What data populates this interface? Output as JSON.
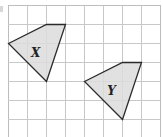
{
  "diagram": {
    "grid": {
      "origin_x": 8,
      "origin_y": 5,
      "cell": 19,
      "cols": 8,
      "rows": 7,
      "line_color": "#c8c8c8",
      "border_color": "#bdbdbd"
    },
    "shapes": [
      {
        "label": "X",
        "vertices": [
          [
            0,
            2
          ],
          [
            2,
            1
          ],
          [
            3,
            1
          ],
          [
            2,
            4
          ]
        ],
        "fill": "#dcdcdc",
        "stroke": "#2a2a2a",
        "label_pos": [
          1.45,
          2.55
        ]
      },
      {
        "label": "Y",
        "vertices": [
          [
            4,
            4
          ],
          [
            6,
            3
          ],
          [
            7,
            3
          ],
          [
            6,
            6
          ]
        ],
        "fill": "#dcdcdc",
        "stroke": "#2a2a2a",
        "label_pos": [
          5.45,
          4.55
        ]
      }
    ]
  }
}
